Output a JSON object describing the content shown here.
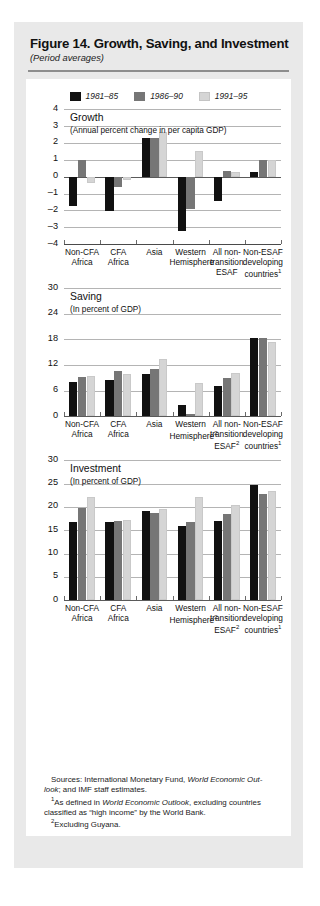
{
  "figure": {
    "title": "Figure 14.  Growth, Saving, and Investment",
    "subtitle": "(Period averages)"
  },
  "legend": {
    "position": "top-center",
    "items": [
      {
        "label": "1981–85",
        "color": "#111111"
      },
      {
        "label": "1986–90",
        "color": "#767676"
      },
      {
        "label": "1991–95",
        "color": "#d5d5d5"
      }
    ]
  },
  "footnotes": {
    "sources_prefix": "Sources: International Monetary Fund, ",
    "sources_italic": "World Economic Out-",
    "sources_line2_italic": "look",
    "sources_line2_rest": "; and IMF staff estimates.",
    "note1_pre": "As defined in ",
    "note1_italic": "World Economic Outlook",
    "note1_post": ", excluding countries classified as “high income” by the World Bank.",
    "note2": "Excluding Guyana."
  },
  "chart_data": [
    {
      "type": "bar",
      "title": "Growth",
      "subtitle": "(Annual percent change in per capita GDP)",
      "xlabel": "",
      "ylabel": "",
      "ylim": [
        -4,
        4
      ],
      "yticks": [
        4,
        3,
        2,
        1,
        0,
        -1,
        -2,
        -3,
        -4
      ],
      "ytick_labels": [
        "4",
        "3",
        "2",
        "1",
        "0",
        "–1",
        "–2",
        "–3",
        "–4"
      ],
      "grid": true,
      "categories": [
        "Non-CFA Africa",
        "CFA Africa",
        "Asia",
        "Western Hemisphere",
        "All non-transition ESAF",
        "Non-ESAF developing countries"
      ],
      "category_lines": [
        [
          "Non-CFA",
          "Africa"
        ],
        [
          "CFA",
          "Africa"
        ],
        [
          "Asia"
        ],
        [
          "Western",
          "Hemisphere"
        ],
        [
          "All non-",
          "transition",
          "ESAF"
        ],
        [
          "Non-ESAF",
          "developing",
          "countries"
        ]
      ],
      "category_superscripts": [
        "",
        "",
        "",
        "",
        "",
        "1"
      ],
      "series": [
        {
          "name": "1981–85",
          "color": "#111111",
          "values": [
            -1.75,
            -2.05,
            2.3,
            -3.2,
            -1.45,
            0.3
          ]
        },
        {
          "name": "1986–90",
          "color": "#767676",
          "values": [
            1.0,
            -0.6,
            2.3,
            -1.9,
            0.35,
            1.0
          ]
        },
        {
          "name": "1991–95",
          "color": "#d5d5d5",
          "values": [
            -0.4,
            -0.2,
            2.65,
            1.5,
            0.3,
            1.0
          ]
        }
      ]
    },
    {
      "type": "bar",
      "title": "Saving",
      "subtitle": "(In percent of GDP)",
      "xlabel": "",
      "ylabel": "",
      "ylim": [
        0,
        30
      ],
      "yticks": [
        30,
        24,
        18,
        12,
        6,
        0
      ],
      "ytick_labels": [
        "30",
        "24",
        "18",
        "12",
        "6",
        "0"
      ],
      "grid": true,
      "categories": [
        "Non-CFA Africa",
        "CFA Africa",
        "Asia",
        "Western Hemisphere",
        "All non-transition ESAF",
        "Non-ESAF developing countries"
      ],
      "category_lines": [
        [
          "Non-CFA",
          "Africa"
        ],
        [
          "CFA",
          "Africa"
        ],
        [
          "Asia"
        ],
        [
          "Western",
          "Hemisphere"
        ],
        [
          "All non-",
          "transition",
          "ESAF"
        ],
        [
          "Non-ESAF",
          "developing",
          "countries"
        ]
      ],
      "category_superscripts": [
        "",
        "",
        "",
        "2",
        "2",
        "1"
      ],
      "series": [
        {
          "name": "1981–85",
          "color": "#111111",
          "values": [
            8.1,
            8.4,
            9.8,
            2.6,
            7.0,
            18.4
          ]
        },
        {
          "name": "1986–90",
          "color": "#767676",
          "values": [
            9.2,
            10.5,
            11.1,
            0.4,
            9.0,
            18.3
          ]
        },
        {
          "name": "1991–95",
          "color": "#d5d5d5",
          "values": [
            9.3,
            9.9,
            13.4,
            7.7,
            10.1,
            17.4
          ]
        }
      ]
    },
    {
      "type": "bar",
      "title": "Investment",
      "subtitle": "(In percent of GDP)",
      "xlabel": "",
      "ylabel": "",
      "ylim": [
        0,
        30
      ],
      "yticks": [
        30,
        25,
        20,
        15,
        10,
        5,
        0
      ],
      "ytick_labels": [
        "30",
        "25",
        "20",
        "15",
        "10",
        "5",
        "0"
      ],
      "grid": true,
      "categories": [
        "Non-CFA Africa",
        "CFA Africa",
        "Asia",
        "Western Hemisphere",
        "All non-transition ESAF",
        "Non-ESAF developing countries"
      ],
      "category_lines": [
        [
          "Non-CFA",
          "Africa"
        ],
        [
          "CFA",
          "Africa"
        ],
        [
          "Asia"
        ],
        [
          "Western",
          "Hemisphere"
        ],
        [
          "All non-",
          "transition",
          "ESAF"
        ],
        [
          "Non-ESAF",
          "developing",
          "countries"
        ]
      ],
      "category_superscripts": [
        "",
        "",
        "",
        "2",
        "2",
        "1"
      ],
      "series": [
        {
          "name": "1981–85",
          "color": "#111111",
          "values": [
            16.8,
            16.7,
            19.2,
            16.0,
            17.0,
            24.7
          ]
        },
        {
          "name": "1986–90",
          "color": "#767676",
          "values": [
            19.7,
            17.0,
            18.7,
            16.7,
            18.5,
            22.7
          ]
        },
        {
          "name": "1991–95",
          "color": "#d5d5d5",
          "values": [
            22.1,
            17.2,
            19.5,
            22.1,
            20.4,
            23.4
          ]
        }
      ]
    }
  ]
}
